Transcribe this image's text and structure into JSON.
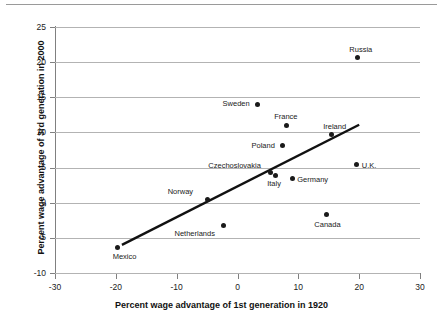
{
  "chart_data": {
    "type": "scatter",
    "title": "",
    "xlabel": "Percent wage advantage of 1st generation in 1920",
    "ylabel": "Percent wage advantage of 3rd generation in 2000",
    "xlim": [
      -30,
      30
    ],
    "ylim": [
      -10,
      25
    ],
    "xticks": [
      -30,
      -20,
      -10,
      0,
      10,
      20,
      30
    ],
    "yticks": [
      -10,
      -5,
      0,
      5,
      10,
      15,
      20,
      25
    ],
    "xtick_labels": [
      "-30",
      "-20",
      "-10",
      "0",
      "10",
      "20",
      "30"
    ],
    "ytick_labels": [
      "-10",
      "-5",
      "0",
      "5",
      "10",
      "15",
      "20",
      "25"
    ],
    "grid": "horizontal",
    "legend": "none",
    "marker_color": "#1a1a1a",
    "trendline_color": "#111111",
    "points": [
      {
        "label": "Mexico",
        "x": -19.7,
        "y": -6.4,
        "label_dx": -5,
        "label_dy": 5
      },
      {
        "label": "Norway",
        "x": -4.9,
        "y": 0.5,
        "label_dx": -40,
        "label_dy": -11
      },
      {
        "label": "Netherlands",
        "x": -2.3,
        "y": -3.2,
        "label_dx": -49,
        "label_dy": 5
      },
      {
        "label": "Sweden",
        "x": 3.3,
        "y": 14.0,
        "label_dx": -35,
        "label_dy": -4
      },
      {
        "label": "Czechoslovakia",
        "x": 5.4,
        "y": 4.3,
        "label_dx": -62,
        "label_dy": -10
      },
      {
        "label": "Italy",
        "x": 6.2,
        "y": 3.9,
        "label_dx": -8,
        "label_dy": 5
      },
      {
        "label": "Poland",
        "x": 7.4,
        "y": 8.1,
        "label_dx": -31,
        "label_dy": -4
      },
      {
        "label": "France",
        "x": 8.0,
        "y": 11.0,
        "label_dx": -12,
        "label_dy": -12
      },
      {
        "label": "Germany",
        "x": 9.0,
        "y": 3.4,
        "label_dx": 5,
        "label_dy": -3
      },
      {
        "label": "Canada",
        "x": 14.6,
        "y": -1.7,
        "label_dx": -12,
        "label_dy": 6
      },
      {
        "label": "Ireland",
        "x": 15.4,
        "y": 9.7,
        "label_dx": -8,
        "label_dy": -12
      },
      {
        "label": "Russia",
        "x": 19.7,
        "y": 20.7,
        "label_dx": -8,
        "label_dy": -11
      },
      {
        "label": "U.K.",
        "x": 19.6,
        "y": 5.4,
        "label_dx": 5,
        "label_dy": -3
      }
    ],
    "trendline": {
      "x1": -19.0,
      "y1": -6.0,
      "x2": 20.0,
      "y2": 11.1
    }
  }
}
